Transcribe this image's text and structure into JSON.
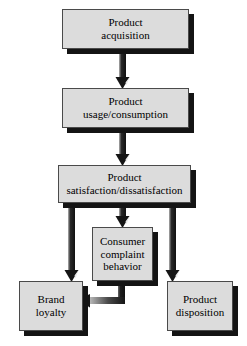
{
  "diagram": {
    "style": {
      "node_fill": "#dcdcdc",
      "node_border": "#4a4a4a",
      "shadow_color": "#141414",
      "arrow_dark": "#1a1a1a",
      "arrow_light": "#b4b4b4",
      "background": "#ffffff",
      "text_color": "#000000"
    },
    "nodes": [
      {
        "id": "product-acquisition",
        "lines": [
          "Product",
          "acquisition"
        ],
        "x": 62,
        "y": 9,
        "w": 127,
        "h": 40,
        "font_size": 11
      },
      {
        "id": "product-usage-consumption",
        "lines": [
          "Product",
          "usage/consumption"
        ],
        "x": 62,
        "y": 88,
        "w": 127,
        "h": 40,
        "font_size": 11
      },
      {
        "id": "product-satisfaction-dissatisfaction",
        "lines": [
          "Product",
          "satisfaction/dissatisfaction"
        ],
        "x": 58,
        "y": 165,
        "w": 133,
        "h": 38,
        "font_size": 11
      },
      {
        "id": "consumer-complaint-behavior",
        "lines": [
          "Consumer",
          "complaint",
          "behavior"
        ],
        "x": 92,
        "y": 227,
        "w": 61,
        "h": 54,
        "font_size": 11
      },
      {
        "id": "brand-loyalty",
        "lines": [
          "Brand",
          "loyalty"
        ],
        "x": 19,
        "y": 281,
        "w": 64,
        "h": 50,
        "font_size": 11
      },
      {
        "id": "product-disposition",
        "lines": [
          "Product",
          "disposition"
        ],
        "x": 167,
        "y": 281,
        "w": 66,
        "h": 50,
        "font_size": 11
      }
    ],
    "connectors": [
      {
        "id": "acquisition-to-usage",
        "from": "product-acquisition",
        "to": "product-usage-consumption"
      },
      {
        "id": "usage-to-satisfaction",
        "from": "product-usage-consumption",
        "to": "product-satisfaction-dissatisfaction"
      },
      {
        "id": "satisfaction-to-complaint",
        "from": "product-satisfaction-dissatisfaction",
        "to": "consumer-complaint-behavior"
      },
      {
        "id": "satisfaction-to-brand-loyalty",
        "from": "product-satisfaction-dissatisfaction",
        "to": "brand-loyalty"
      },
      {
        "id": "satisfaction-to-disposition",
        "from": "product-satisfaction-dissatisfaction",
        "to": "product-disposition"
      },
      {
        "id": "complaint-to-brand-loyalty",
        "from": "consumer-complaint-behavior",
        "to": "brand-loyalty"
      }
    ]
  }
}
